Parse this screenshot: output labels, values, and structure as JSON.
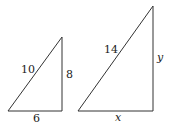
{
  "figure": {
    "small_triangle": {
      "hypotenuse": "10",
      "vertical_leg": "8",
      "horizontal_leg": "6"
    },
    "large_triangle": {
      "hypotenuse": "14",
      "vertical_leg": "y",
      "horizontal_leg": "x"
    },
    "stroke_color": "#333333"
  }
}
